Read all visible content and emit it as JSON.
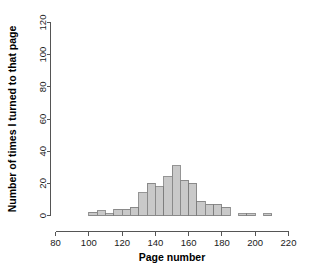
{
  "chart_data": {
    "type": "bar",
    "subtype": "histogram",
    "title": "",
    "subtitle": "",
    "xlabel": "Page number",
    "ylabel": "Number of times I turned to that page",
    "xlim": [
      80,
      220
    ],
    "ylim": [
      0,
      120
    ],
    "xticks": [
      80,
      100,
      120,
      140,
      160,
      180,
      200,
      220
    ],
    "yticks": [
      0,
      20,
      40,
      60,
      80,
      100,
      120
    ],
    "xtick_labels": [
      "80",
      "100",
      "120",
      "140",
      "160",
      "180",
      "200",
      "220"
    ],
    "ytick_labels": [
      "0",
      "20",
      "40",
      "60",
      "80",
      "100",
      "120"
    ],
    "grid": false,
    "legend": false,
    "legend_position": "none",
    "bin_width": 5,
    "bin_starts": [
      100,
      105,
      110,
      115,
      120,
      125,
      130,
      135,
      140,
      145,
      150,
      155,
      160,
      165,
      170,
      175,
      180,
      185,
      190,
      195,
      200,
      205,
      210
    ],
    "categories": [
      "100-105",
      "105-110",
      "110-115",
      "115-120",
      "120-125",
      "125-130",
      "130-135",
      "135-140",
      "140-145",
      "145-150",
      "150-155",
      "155-160",
      "160-165",
      "165-170",
      "170-175",
      "175-180",
      "180-185",
      "185-190",
      "190-195",
      "195-200",
      "200-205",
      "205-210",
      "210-215"
    ],
    "values": [
      2,
      3,
      1,
      4,
      4,
      5,
      14,
      20,
      18,
      24,
      31,
      22,
      20,
      9,
      7,
      7,
      5,
      0,
      1,
      1,
      0,
      1,
      0
    ],
    "bar_fill_color": "#c9c9c9",
    "bar_edge_color": "#7a7a7a",
    "axis_color": "#555555",
    "background_color": "#ffffff"
  }
}
